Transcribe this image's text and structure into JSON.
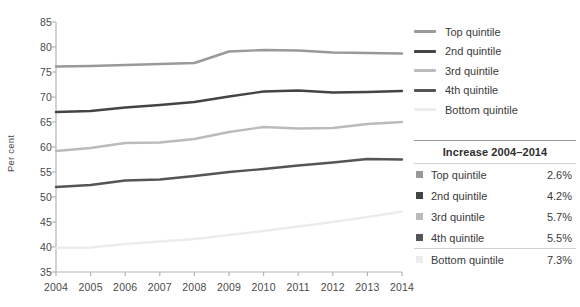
{
  "chart_data": {
    "type": "line",
    "title": "",
    "xlabel": "",
    "ylabel": "Per cent",
    "x": [
      2004,
      2005,
      2006,
      2007,
      2008,
      2009,
      2010,
      2011,
      2012,
      2013,
      2014
    ],
    "xlim": [
      2004,
      2014
    ],
    "ylim": [
      35,
      85
    ],
    "yticks": [
      35,
      40,
      45,
      50,
      55,
      60,
      65,
      70,
      75,
      80,
      85
    ],
    "xticks": [
      "2004",
      "2005",
      "2006",
      "2007",
      "2008",
      "2009",
      "2010",
      "2011",
      "2012",
      "2013",
      "2014"
    ],
    "grid": false,
    "legend_position": "right",
    "series": [
      {
        "name": "Top quintile",
        "color": "#999999",
        "values": [
          76.1,
          76.2,
          76.4,
          76.6,
          76.8,
          79.1,
          79.4,
          79.3,
          78.9,
          78.8,
          78.7
        ]
      },
      {
        "name": "2nd quintile",
        "color": "#444444",
        "values": [
          67.0,
          67.2,
          67.9,
          68.4,
          69.0,
          70.1,
          71.1,
          71.3,
          70.9,
          71.0,
          71.2
        ]
      },
      {
        "name": "3rd quintile",
        "color": "#bbbbbb",
        "values": [
          59.2,
          59.8,
          60.8,
          60.9,
          61.6,
          63.0,
          64.0,
          63.7,
          63.8,
          64.6,
          65.0
        ]
      },
      {
        "name": "4th quintile",
        "color": "#555555",
        "values": [
          52.0,
          52.4,
          53.3,
          53.5,
          54.2,
          55.0,
          55.6,
          56.3,
          56.9,
          57.6,
          57.5
        ]
      },
      {
        "name": "Bottom quintile",
        "color": "#ececec",
        "values": [
          39.8,
          39.9,
          40.6,
          41.1,
          41.6,
          42.4,
          43.2,
          44.1,
          45.0,
          46.0,
          47.1
        ]
      }
    ]
  },
  "legend": {
    "items": [
      {
        "label": "Top quintile",
        "color": "#999999"
      },
      {
        "label": "2nd quintile",
        "color": "#444444"
      },
      {
        "label": "3rd quintile",
        "color": "#bbbbbb"
      },
      {
        "label": "4th quintile",
        "color": "#555555"
      },
      {
        "label": "Bottom quintile",
        "color": "#ececec"
      }
    ]
  },
  "table": {
    "header": "Increase 2004–2014",
    "rows": [
      {
        "label": "Top quintile",
        "value": "2.6%",
        "color": "#999999"
      },
      {
        "label": "2nd quintile",
        "value": "4.2%",
        "color": "#444444"
      },
      {
        "label": "3rd quintile",
        "value": "5.7%",
        "color": "#bbbbbb"
      },
      {
        "label": "4th quintile",
        "value": "5.5%",
        "color": "#555555"
      },
      {
        "label": "Bottom quintile",
        "value": "7.3%",
        "color": "#ececec"
      }
    ]
  },
  "axis": {
    "y_title": "Per cent"
  }
}
